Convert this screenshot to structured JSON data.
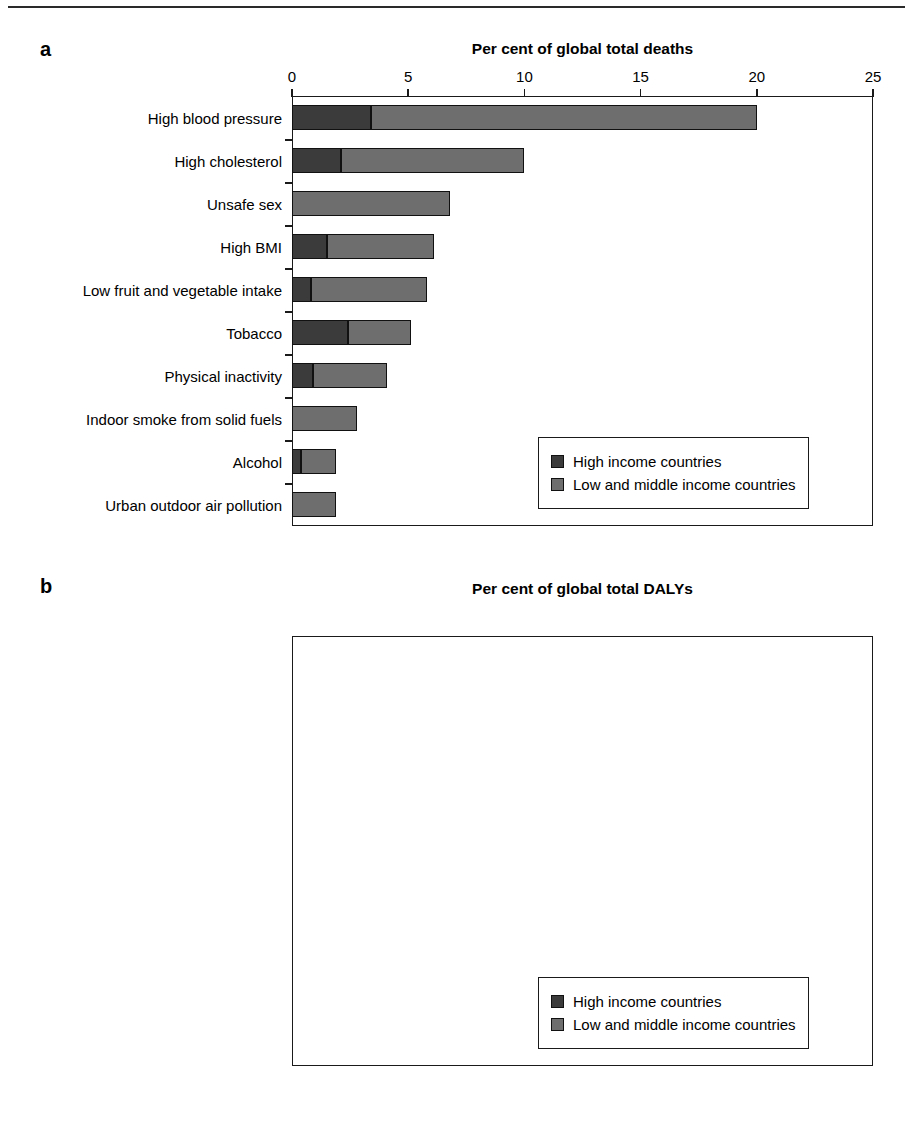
{
  "figure": {
    "top_rule": true
  },
  "legend": {
    "items": [
      {
        "label": "High income countries",
        "color": "#3b3b3b",
        "key": "high"
      },
      {
        "label": "Low and middle income countries",
        "color": "#6e6e6e",
        "key": "low"
      }
    ]
  },
  "panels": [
    {
      "letter": "a",
      "title": "Per cent of global total deaths",
      "chart_data": {
        "type": "bar",
        "orientation": "horizontal",
        "stacked": true,
        "title": "Per cent of global total deaths",
        "xlabel": "Per cent of global total deaths",
        "ylabel": "",
        "xlim": [
          0,
          25
        ],
        "xticks": [
          0,
          5,
          10,
          15,
          20,
          25
        ],
        "xtick_labels": [
          "0",
          "5",
          "10",
          "15",
          "20",
          "25"
        ],
        "grid": false,
        "legend_position": "inside-bottom-right",
        "categories": [
          "High blood pressure",
          "High cholesterol",
          "Unsafe sex",
          "High BMI",
          "Low fruit and vegetable intake",
          "Tobacco",
          "Physical inactivity",
          "Indoor smoke from solid fuels",
          "Alcohol",
          "Urban outdoor air pollution"
        ],
        "series": [
          {
            "name": "High income countries",
            "color": "#3b3b3b",
            "values": [
              3.4,
              2.1,
              0.0,
              1.5,
              0.8,
              2.4,
              0.9,
              0.0,
              0.4,
              0.0
            ]
          },
          {
            "name": "Low and middle income countries",
            "color": "#6e6e6e",
            "values": [
              16.6,
              7.9,
              6.8,
              4.6,
              5.0,
              2.7,
              3.2,
              2.8,
              1.5,
              1.9
            ]
          }
        ],
        "totals": [
          20.0,
          10.0,
          6.8,
          6.1,
          5.8,
          5.1,
          4.1,
          2.8,
          1.9,
          1.9
        ]
      }
    },
    {
      "letter": "b",
      "title": "Per cent of global total DALYs",
      "chart_data": {
        "type": "bar",
        "orientation": "horizontal",
        "stacked": true,
        "title": "Per cent of global total DALYs",
        "xlabel": "Per cent of global total DALYs",
        "ylabel": "",
        "xlim": [
          0,
          10
        ],
        "xticks": [
          0,
          1,
          2,
          3,
          4,
          5,
          6,
          7,
          8,
          9,
          10
        ],
        "xtick_labels": [
          "0",
          "1",
          "2",
          "3",
          "4",
          "5",
          "6",
          "7",
          "8",
          "9",
          "10"
        ],
        "grid": false,
        "legend_position": "inside-bottom-right",
        "categories": [
          "Unsafe sex",
          "High blood pressure",
          "High cholesterol",
          "High BMI",
          "Tobacco",
          "Low fruit and vegetable intake",
          "Physical inactivity",
          "Alcohol",
          "Lack of contraception",
          "Iron deficiency"
        ],
        "series": [
          {
            "name": "High income countries",
            "color": "#3b3b3b",
            "values": [
              0.1,
              0.67,
              0.42,
              0.8,
              1.02,
              0.15,
              0.3,
              0.45,
              0.0,
              0.0
            ]
          },
          {
            "name": "Low and middle income countries",
            "color": "#6e6e6e",
            "values": [
              9.5,
              6.33,
              3.48,
              3.0,
              1.68,
              2.35,
              1.85,
              1.55,
              1.75,
              1.45
            ]
          }
        ],
        "totals": [
          9.6,
          7.0,
          3.9,
          3.8,
          2.7,
          2.5,
          2.15,
          2.0,
          1.75,
          1.45
        ]
      }
    }
  ]
}
